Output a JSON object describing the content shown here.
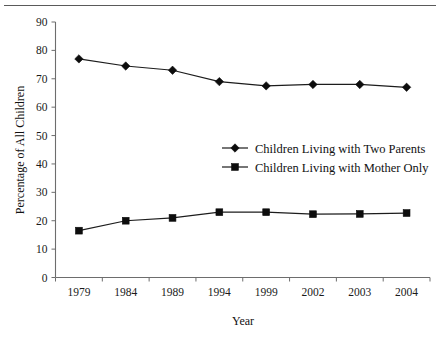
{
  "chart_data": {
    "type": "line",
    "title": "",
    "xlabel": "Year",
    "ylabel": "Percentage of All Children",
    "categories": [
      "1979",
      "1984",
      "1989",
      "1994",
      "1999",
      "2002",
      "2003",
      "2004"
    ],
    "ylim": [
      0,
      90
    ],
    "ytick_step": 10,
    "yticks": [
      "0",
      "10",
      "20",
      "30",
      "40",
      "50",
      "60",
      "70",
      "80",
      "90"
    ],
    "grid": false,
    "legend_position": "center-right",
    "series": [
      {
        "name": "Children Living with Two Parents",
        "marker": "diamond",
        "color": "#0d0d0d",
        "values": [
          77,
          74.5,
          73,
          69,
          67.5,
          68,
          68,
          67
        ]
      },
      {
        "name": "Children Living with Mother Only",
        "marker": "square",
        "color": "#0d0d0d",
        "values": [
          16.5,
          20,
          21,
          23,
          23,
          22.3,
          22.4,
          22.7
        ]
      }
    ]
  },
  "figure": {
    "top_rule": "horizontal-rule",
    "background_color": "#ffffff",
    "axis_color": "#6d6d6d"
  }
}
